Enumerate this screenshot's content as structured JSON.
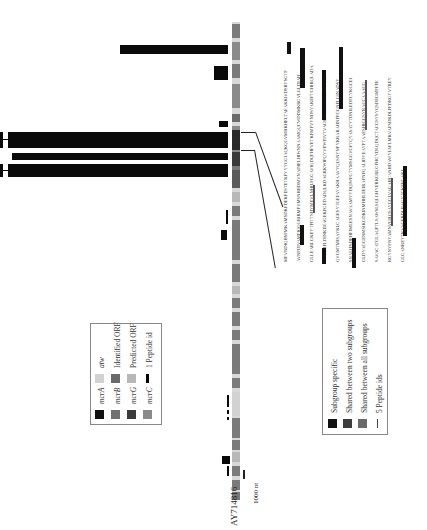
{
  "figure": {
    "accession_label": "AY714816",
    "scale_label": "1000 nt",
    "track_colors": {
      "mcrA": "#111111",
      "mcrB": "#707070",
      "mcrG": "#3a3a3a",
      "mcrC": "#8a8a8a",
      "atw": "#d2d2d2",
      "identified_orf": "#6a6a6a",
      "predicted_orf": "#b8b8b8",
      "peptide": "#000000"
    }
  },
  "legend_genes": {
    "items": [
      {
        "swatch": "mcrA-swatch",
        "label": "mcrA"
      },
      {
        "swatch": "mcrB-swatch",
        "label": "mcrB"
      },
      {
        "swatch": "mcrG-swatch",
        "label": "mcrG"
      },
      {
        "swatch": "mcrC-swatch",
        "label": "mcrC"
      },
      {
        "swatch": "atw-swatch",
        "label": "atw"
      },
      {
        "swatch": "identified-orf-swatch",
        "label": "Identified ORF"
      },
      {
        "swatch": "predicted-orf-swatch",
        "label": "Predicted ORF"
      },
      {
        "swatch": "peptide-swatch",
        "label": "1 Peptide id"
      }
    ]
  },
  "legend_peptides": {
    "items": [
      {
        "label": "Subgroup specific",
        "color": "#111111"
      },
      {
        "label": "Shared between two subgroups",
        "color": "#3c3c3c"
      },
      {
        "label": "Shared between all subgroups",
        "color": "#6a6a6a"
      },
      {
        "label": "5 Peptide ids",
        "color": "#444444"
      }
    ]
  },
  "sequence": {
    "lines": [
      "MPVNDIQHSFMKAMSDKFDEKPESTETKFYYYGGIAQKQGVMHKHELTAEAKKIVDSRYSGTP",
      "AVNPDIVAMPIQGGRIRMPVMSNHIIDMVNADIELHIWNNAAMQQCWDDMKRGVLGLDIAH",
      "GLLEARLGKEYTPITTSHYMEVLNHILPGGAVIQDQFHFVETKPMFVYNDSYAKEFTGHIRQLADA",
      "VYRERFLDINKEEAGEKPGEDADQLKDAGRKWIPQYVEWPIVTVAGRVTDSGTMERWVGM",
      "QVGMTMISAYKLCAGESYTGEFAYAKHAAVYQLSNYNPYKRARAHNFPGGNPLGINADSY",
      "SNALIPSDEHPIMLESNAVAAMYYDQIWFGTYMSGGVGFTQYASATYTDNILEDFCYKGCEI",
      "GLDYAGGENMSIKGDKINMHHLEEIRAFNPQALIDYEAYPTAAESHIGGSYRACCAAACG",
      "SAVACATGLAQPTLSAWSLSQLGHYERKGRLGFHGYDLQDQCTACGSYSYQSDEGMPFPE",
      "RGYNYPNYAMNVGHQSAYGGLVAGAHCANHDAWYLSPLMKVAFSDRDLPFDRGYVTREY",
      "GLGANREYTKVAGERDLIIAGYTGKEPGAKL"
    ]
  }
}
